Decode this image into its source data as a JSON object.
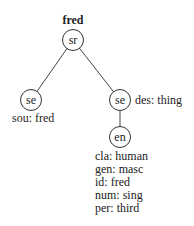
{
  "tree": {
    "root": {
      "label": "sr",
      "title": "fred",
      "children": [
        {
          "label": "se",
          "attrs": [
            "sou: fred"
          ]
        },
        {
          "label": "se",
          "attrs": [
            "des: thing"
          ],
          "children": [
            {
              "label": "en",
              "attrs": [
                "cla: human",
                "gen: masc",
                "id: fred",
                "num: sing",
                "per: third"
              ]
            }
          ]
        }
      ]
    }
  }
}
